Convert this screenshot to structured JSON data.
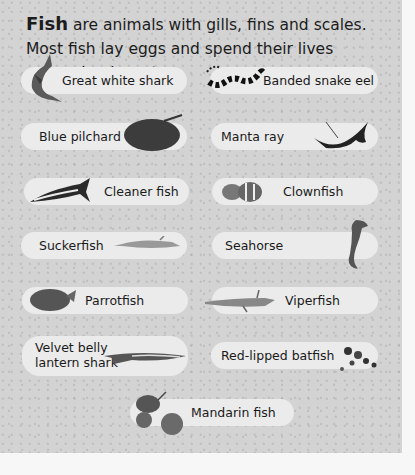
{
  "intro": {
    "bold": "Fish",
    "text": " are animals with gills, fins and scales. Most fish lay eggs and spend their lives swimming in water."
  },
  "colors": {
    "panel": "#d3d3d3",
    "pill": "#ebebeb",
    "page": "#f7f7f7",
    "text": "#1a1a1a"
  },
  "fish": [
    {
      "label": "Great white shark",
      "icon": "shark-icon"
    },
    {
      "label": "Banded snake eel",
      "icon": "snake-eel-icon"
    },
    {
      "label": "Blue pilchard",
      "icon": "pilchard-icon"
    },
    {
      "label": "Manta ray",
      "icon": "manta-ray-icon"
    },
    {
      "label": "Cleaner fish",
      "icon": "cleaner-fish-icon"
    },
    {
      "label": "Clownfish",
      "icon": "clownfish-icon"
    },
    {
      "label": "Suckerfish",
      "icon": "suckerfish-icon"
    },
    {
      "label": "Seahorse",
      "icon": "seahorse-icon"
    },
    {
      "label": "Parrotfish",
      "icon": "parrotfish-icon"
    },
    {
      "label": "Viperfish",
      "icon": "viperfish-icon"
    },
    {
      "label_line1": "Velvet belly",
      "label_line2": "lantern shark",
      "icon": "lantern-shark-icon"
    },
    {
      "label": "Red-lipped batfish",
      "icon": "batfish-icon"
    },
    {
      "label": "Mandarin fish",
      "icon": "mandarin-fish-icon"
    }
  ]
}
